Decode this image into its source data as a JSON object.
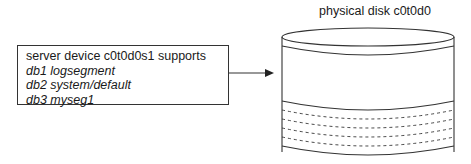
{
  "server_box": {
    "lines": [
      {
        "text": "server device c0t0d0s1 supports",
        "italic": false
      },
      {
        "text": "db1 logsegment",
        "italic": true
      },
      {
        "text": "db2 system/default",
        "italic": true
      },
      {
        "text": "db3 myseg1",
        "italic": true
      }
    ]
  },
  "disk": {
    "title": "physical disk c0t0d0",
    "dashed_segments": 4
  },
  "colors": {
    "stroke": "#333333",
    "background": "#ffffff"
  }
}
